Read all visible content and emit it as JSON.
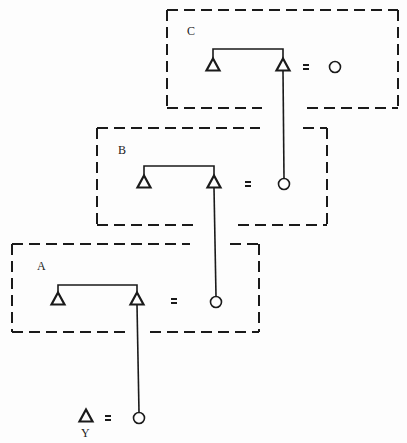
{
  "diagram": {
    "stroke_color": "#1a1a1a",
    "background": "#fdfdfd",
    "equals_symbol": "=",
    "boxes": [
      {
        "id": "C",
        "label": "C",
        "rect": {
          "x1": 167,
          "y1": 10,
          "x2": 398,
          "y2": 108
        },
        "bottom_gap": [
          262,
          307
        ],
        "top_gap": null,
        "left_triangle": {
          "x": 213,
          "y": 65
        },
        "right_triangle": {
          "x": 283,
          "y": 65
        },
        "bracket_y": 49,
        "equals_x": 306,
        "circle": {
          "x": 335,
          "y": 67
        }
      },
      {
        "id": "B",
        "label": "B",
        "rect": {
          "x1": 97,
          "y1": 128,
          "x2": 327,
          "y2": 225
        },
        "bottom_gap": [
          197,
          238
        ],
        "top_gap": [
          260,
          303
        ],
        "left_triangle": {
          "x": 144,
          "y": 182
        },
        "right_triangle": {
          "x": 214,
          "y": 182
        },
        "bracket_y": 166,
        "equals_x": 248,
        "circle": {
          "x": 284,
          "y": 184
        }
      },
      {
        "id": "A",
        "label": "A",
        "rect": {
          "x1": 12,
          "y1": 244,
          "x2": 259,
          "y2": 332
        },
        "bottom_gap": [
          125,
          150
        ],
        "top_gap": [
          190,
          230
        ],
        "left_triangle": {
          "x": 58,
          "y": 299
        },
        "right_triangle": {
          "x": 137,
          "y": 299
        },
        "bracket_y": 285,
        "equals_x": 174,
        "circle": {
          "x": 216,
          "y": 302
        }
      }
    ],
    "output": {
      "label": "Y",
      "triangle": {
        "x": 86,
        "y": 416
      },
      "equals_x": 108,
      "circle": {
        "x": 139,
        "y": 418
      }
    },
    "connectors": [
      {
        "from": "C.right_triangle",
        "to": "B.circle"
      },
      {
        "from": "B.right_triangle",
        "to": "A.circle"
      },
      {
        "from": "A.right_triangle",
        "to": "output.circle"
      }
    ]
  }
}
